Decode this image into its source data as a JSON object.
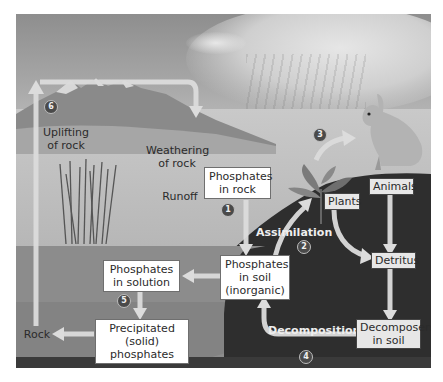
{
  "diagram": {
    "colors": {
      "arrow": "#dcdcdc",
      "soil": "#2e2e2e",
      "water": "#8c8c8c",
      "sky": "#a0a0a0",
      "badge": "#4a4a4a"
    },
    "steps": [
      {
        "number": "1",
        "position": "below Phosphates in rock"
      },
      {
        "number": "2",
        "position": "below Assimilation"
      },
      {
        "number": "3",
        "position": "plants to animals"
      },
      {
        "number": "4",
        "position": "below Decomposition"
      },
      {
        "number": "5",
        "position": "solution to precipitate"
      },
      {
        "number": "6",
        "position": "uplifting of rock"
      }
    ],
    "boxed_labels": {
      "phosphates_rock": {
        "line1": "Phosphates",
        "line2": "in rock"
      },
      "phosphates_soil": {
        "line1": "Phosphates",
        "line2": "in soil",
        "line3": "(inorganic)"
      },
      "phosphates_solution": {
        "line1": "Phosphates",
        "line2": "in solution"
      },
      "precipitated": {
        "line1": "Precipitated",
        "line2": "(solid) phosphates"
      },
      "plants": "Plants",
      "animals": "Animals",
      "detritus": "Detritus",
      "decomposers": {
        "line1": "Decomposers",
        "line2": "in soil"
      }
    },
    "plain_labels": {
      "uplifting": {
        "line1": "Uplifting",
        "line2": "of rock"
      },
      "weathering": {
        "line1": "Weathering",
        "line2": "of rock"
      },
      "runoff": "Runoff",
      "rock": "Rock"
    },
    "process_labels": {
      "assimilation": "Assimilation",
      "decomposition": "Decomposition"
    },
    "nodes": [
      "Phosphates in rock",
      "Phosphates in soil (inorganic)",
      "Phosphates in solution",
      "Precipitated (solid) phosphates",
      "Rock",
      "Plants",
      "Animals",
      "Detritus",
      "Decomposers in soil"
    ],
    "edges": [
      {
        "from": "Phosphates in rock",
        "to": "Phosphates in soil (inorganic)",
        "step": "1"
      },
      {
        "from": "Phosphates in soil (inorganic)",
        "to": "Plants",
        "label": "Assimilation",
        "step": "2"
      },
      {
        "from": "Plants",
        "to": "Animals",
        "step": "3"
      },
      {
        "from": "Plants",
        "to": "Detritus"
      },
      {
        "from": "Animals",
        "to": "Detritus"
      },
      {
        "from": "Detritus",
        "to": "Decomposers in soil"
      },
      {
        "from": "Decomposers in soil",
        "to": "Phosphates in soil (inorganic)",
        "label": "Decomposition",
        "step": "4"
      },
      {
        "from": "Phosphates in soil (inorganic)",
        "to": "Phosphates in solution"
      },
      {
        "from": "Phosphates in solution",
        "to": "Precipitated (solid) phosphates",
        "step": "5"
      },
      {
        "from": "Precipitated (solid) phosphates",
        "to": "Rock"
      },
      {
        "from": "Rock",
        "to": "Weathering of rock",
        "label": "Uplifting of rock",
        "step": "6"
      }
    ]
  }
}
